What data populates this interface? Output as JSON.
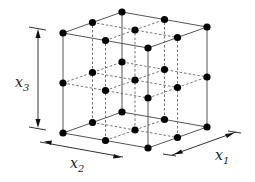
{
  "diagram": {
    "type": "3x3x3 full factorial design points on a cube",
    "axes": [
      {
        "name": "x1",
        "label": "x",
        "subscript": "1"
      },
      {
        "name": "x2",
        "label": "x",
        "subscript": "2"
      },
      {
        "name": "x3",
        "label": "x",
        "subscript": "3"
      }
    ],
    "levels_per_axis": 3,
    "point_count": 27,
    "colors": {
      "points": "#000000",
      "edges": "#555555",
      "background": "#ffffff"
    }
  }
}
